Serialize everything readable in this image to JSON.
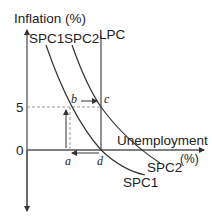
{
  "diagram": {
    "type": "phillips-curve",
    "y_axis_label": "Inflation (%)",
    "x_axis_label": "Unemployment",
    "x_axis_unit": "(%)",
    "y_ticks": [
      "5",
      "0"
    ],
    "curves": {
      "lpc": "LPC",
      "spc1_top": "SPC1",
      "spc2_top": "SPC2",
      "spc1_bottom": "SPC1",
      "spc2_bottom": "SPC2"
    },
    "points": {
      "a": "a",
      "b": "b",
      "c": "c",
      "d": "d"
    },
    "colors": {
      "line": "#333333",
      "dashed": "#999999"
    }
  }
}
